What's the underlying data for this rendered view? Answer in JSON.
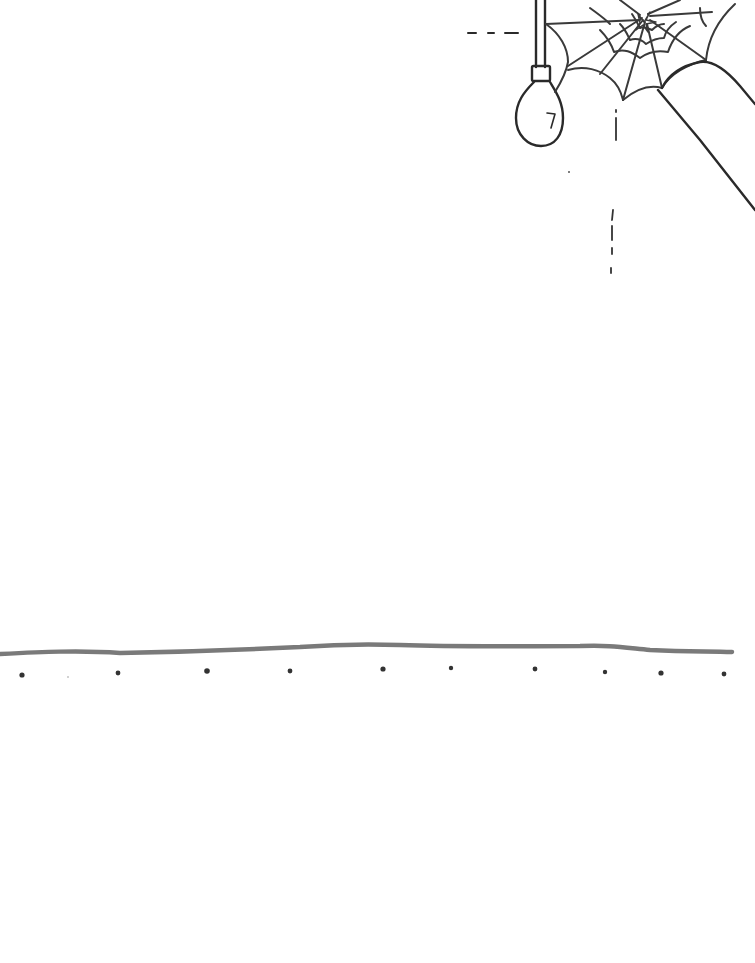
{
  "scene": {
    "description": "Hand-drawn line sketch: hanging light bulb, cobweb in ceiling corner over a diagonal beam, dashed guide lines, a horizon/floor line with a row of dots beneath",
    "background_color": "#ffffff",
    "colors": {
      "ink": "#2a2a2a",
      "web_ink": "#3a3a3a",
      "horizon_line": "#7a7a7a",
      "dots": "#333333"
    },
    "elements": {
      "light_bulb": {
        "cord_x": 538,
        "socket_y": [
          66,
          82
        ],
        "bulb_center": [
          540,
          115
        ]
      },
      "cobweb": {
        "anchor": "top-right corner",
        "extent_x": [
          545,
          735
        ],
        "extent_y": [
          0,
          95
        ]
      },
      "diagonal_beam": {
        "from": [
          655,
          60
        ],
        "to": [
          755,
          210
        ]
      },
      "dashed_guide_horizontal": {
        "y": 32,
        "x_range": [
          468,
          518
        ]
      },
      "dashed_guide_vertical": {
        "x": 612,
        "y_range": [
          110,
          275
        ]
      },
      "horizon_line": {
        "y_approx": 650,
        "x_range": [
          0,
          732
        ]
      },
      "floor_dots_x": [
        22,
        118,
        207,
        290,
        383,
        451,
        535,
        605,
        661,
        724
      ]
    }
  }
}
